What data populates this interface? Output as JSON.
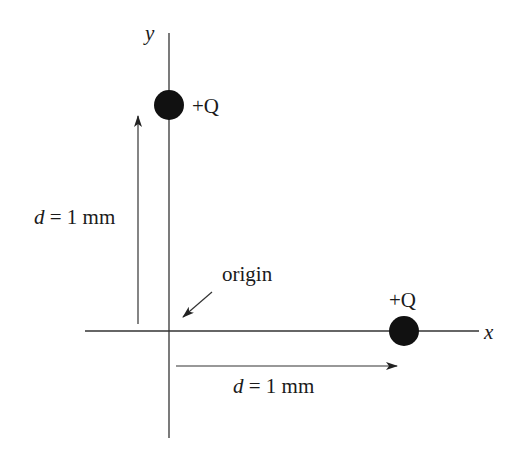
{
  "diagram": {
    "type": "point-charges-on-axes",
    "axes": {
      "x_label": "x",
      "y_label": "y"
    },
    "charges": [
      {
        "id": "charge-on-y-axis",
        "label": "+Q",
        "position": "on y-axis, distance d above origin"
      },
      {
        "id": "charge-on-x-axis",
        "label": "+Q",
        "position": "on x-axis, distance d right of origin"
      }
    ],
    "annotations": {
      "origin_label": "origin",
      "vertical_distance": {
        "var": "d",
        "eq": " = 1 mm"
      },
      "horizontal_distance": {
        "var": "d",
        "eq": " = 1 mm"
      }
    },
    "colors": {
      "line": "#333333",
      "charge_fill": "#111111",
      "text": "#1a1a1a",
      "background": "#ffffff"
    }
  }
}
